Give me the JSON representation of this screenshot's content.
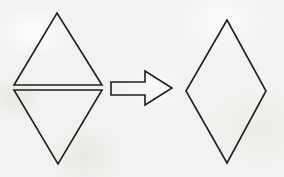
{
  "figure": {
    "background_color": "#f3f2f0",
    "stroke_color": "#211f1e",
    "canvas": {
      "width": 284,
      "height": 177
    },
    "relation_symbol": "arrow-right",
    "left_group": {
      "label": "two triangles",
      "shapes": [
        {
          "name": "upper-triangle",
          "type": "triangle",
          "orientation": "point-up",
          "stroke_width": 1.6,
          "points": "57,13 102,85 14,85",
          "vertices": [
            {
              "x": 57,
              "y": 13
            },
            {
              "x": 102,
              "y": 85
            },
            {
              "x": 14,
              "y": 85
            }
          ]
        },
        {
          "name": "lower-triangle",
          "type": "triangle",
          "orientation": "point-down",
          "stroke_width": 1.6,
          "points": "14,90 102,90 58,164",
          "vertices": [
            {
              "x": 14,
              "y": 90
            },
            {
              "x": 102,
              "y": 90
            },
            {
              "x": 58,
              "y": 164
            }
          ]
        }
      ]
    },
    "arrow": {
      "name": "transformation-arrow",
      "direction": "right",
      "stroke_width": 1.6,
      "points": "111,82 145,82 145,71 172,88 145,105 145,95 111,95",
      "tip": {
        "x": 172,
        "y": 88
      },
      "tail": {
        "x": 111,
        "y": 88
      }
    },
    "right_group": {
      "label": "rhombus",
      "shapes": [
        {
          "name": "rhombus",
          "type": "rhombus",
          "stroke_width": 1.6,
          "points": "227,20 266,91 227,163 186,91",
          "vertices": [
            {
              "x": 227,
              "y": 20
            },
            {
              "x": 266,
              "y": 91
            },
            {
              "x": 227,
              "y": 163
            },
            {
              "x": 186,
              "y": 91
            }
          ]
        }
      ]
    }
  }
}
